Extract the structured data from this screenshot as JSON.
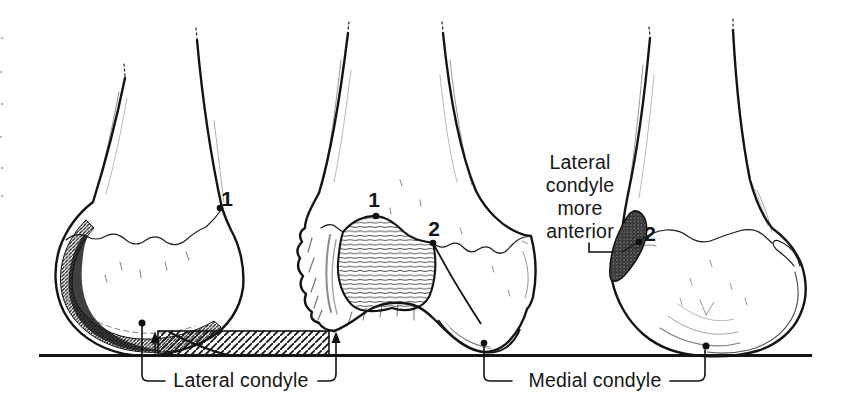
{
  "figure": {
    "colors": {
      "ink": "#1a1a1a",
      "paper": "#ffffff"
    }
  },
  "labels": {
    "marker_1": "1",
    "marker_2": "2",
    "lateral_condyle": "Lateral condyle",
    "medial_condyle": "Medial condyle",
    "lateral_more_anterior_lines": [
      "Lateral",
      "condyle",
      "more",
      "anterior"
    ]
  }
}
